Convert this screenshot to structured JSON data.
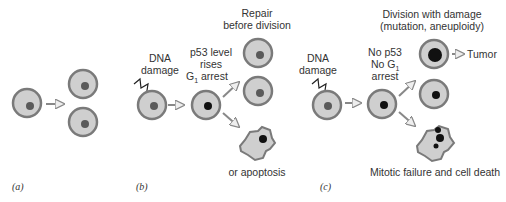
{
  "panels": [
    {
      "id": "a",
      "label": "(a)"
    },
    {
      "id": "b",
      "label": "(b)"
    },
    {
      "id": "c",
      "label": "(c)"
    }
  ],
  "panel_b": {
    "damage_label": [
      "DNA",
      "damage"
    ],
    "arrest_label": [
      "p53 level",
      "rises",
      "G",
      "1",
      " arrest"
    ],
    "repair_label": [
      "Repair",
      "before division"
    ],
    "apoptosis_label": "or apoptosis"
  },
  "panel_c": {
    "damage_label": [
      "DNA",
      "damage"
    ],
    "no_arrest_label": [
      "No p53",
      "No G",
      "1",
      "arrest"
    ],
    "division_label": [
      "Division with damage",
      "(mutation, aneuploidy)"
    ],
    "tumor_label": "Tumor",
    "death_label": "Mitotic failure and cell death"
  },
  "colors": {
    "cell_fill": "#cfcfcf",
    "cell_border": "#7a7a7a",
    "nucleus": "#5a5a5a",
    "nucleus_dark": "#1e1e1e",
    "arrow": "#888888"
  }
}
